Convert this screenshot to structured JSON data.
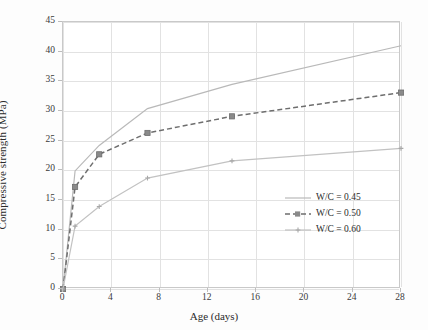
{
  "chart_data": {
    "type": "line",
    "title": "",
    "xlabel": "Age (days)",
    "ylabel": "Compressive strength (MPa)",
    "xlim": [
      0,
      28
    ],
    "ylim": [
      0,
      45
    ],
    "xticks": [
      0,
      4,
      8,
      12,
      16,
      20,
      24,
      28
    ],
    "yticks": [
      0,
      5,
      10,
      15,
      20,
      25,
      30,
      35,
      40,
      45
    ],
    "grid": true,
    "legend_position": "lower-right-inside",
    "series": [
      {
        "name": "W/C = 0.45",
        "color": "#b9b9b9",
        "linestyle": "solid",
        "marker": "none",
        "x": [
          0,
          1,
          3,
          7,
          14,
          28
        ],
        "values": [
          0.0,
          19.9,
          24.2,
          30.4,
          34.5,
          41.0
        ]
      },
      {
        "name": "W/C = 0.50",
        "color": "#6e6e6e",
        "linestyle": "dashed",
        "marker": "square",
        "x": [
          0,
          1,
          3,
          7,
          14,
          28
        ],
        "values": [
          0.0,
          17.2,
          22.7,
          26.3,
          29.1,
          33.1
        ]
      },
      {
        "name": "W/C = 0.60",
        "color": "#c2c2c2",
        "linestyle": "solid",
        "marker": "plus",
        "x": [
          0,
          1,
          3,
          7,
          14,
          28
        ],
        "values": [
          0.0,
          10.6,
          13.9,
          18.7,
          21.6,
          23.7
        ]
      }
    ]
  },
  "legend": {
    "items": [
      {
        "label": "W/C = 0.45"
      },
      {
        "label": "W/C = 0.50"
      },
      {
        "label": "W/C = 0.60"
      }
    ]
  },
  "axes": {
    "x_title": "Age (days)",
    "y_title": "Compressive strength (MPa)"
  }
}
